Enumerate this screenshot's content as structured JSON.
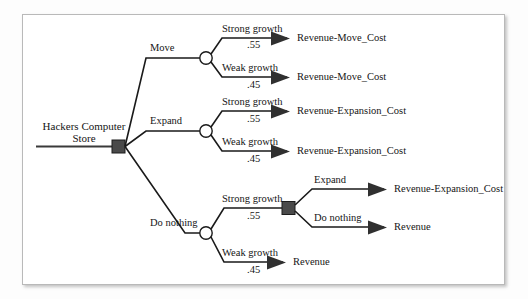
{
  "diagram": {
    "root": {
      "label_line1": "Hackers Computer",
      "label_line2": "Store",
      "node_type": "decision-square"
    },
    "branches": [
      {
        "id": "move",
        "label": "Move",
        "node_type": "chance-circle",
        "outcomes": [
          {
            "label": "Strong growth",
            "probability": ".55",
            "payoff": "Revenue-Move_Cost"
          },
          {
            "label": "Weak growth",
            "probability": ".45",
            "payoff": "Revenue-Move_Cost"
          }
        ]
      },
      {
        "id": "expand",
        "label": "Expand",
        "node_type": "chance-circle",
        "outcomes": [
          {
            "label": "Strong growth",
            "probability": ".55",
            "payoff": "Revenue-Expansion_Cost"
          },
          {
            "label": "Weak growth",
            "probability": ".45",
            "payoff": "Revenue-Expansion_Cost"
          }
        ]
      },
      {
        "id": "do-nothing",
        "label": "Do nothing",
        "node_type": "chance-circle",
        "outcomes": [
          {
            "label": "Strong growth",
            "probability": ".55",
            "payoff": null,
            "sub_decision": {
              "node_type": "decision-square",
              "options": [
                {
                  "label": "Expand",
                  "payoff": "Revenue-Expansion_Cost"
                },
                {
                  "label": "Do nothing",
                  "payoff": "Revenue"
                }
              ]
            }
          },
          {
            "label": "Weak growth",
            "probability": ".45",
            "payoff": "Revenue"
          }
        ]
      }
    ],
    "colors": {
      "edge": "#1a1a1a",
      "decision_node": "#4a4a4a",
      "chance_node": "#ffffff",
      "arrowhead": "#303030",
      "frame_border": "#b9b9b9",
      "background": "#ffffff"
    }
  }
}
